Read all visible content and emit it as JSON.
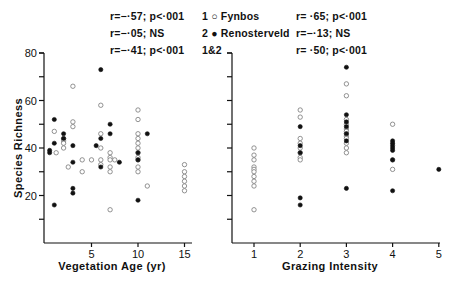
{
  "legend": {
    "items": [
      {
        "number": "1",
        "symbol": "open-circle",
        "label": "Fynbos"
      },
      {
        "number": "2",
        "symbol": "filled-circle",
        "label": "Renosterveld"
      },
      {
        "number": "1&2",
        "symbol": "",
        "label": ""
      }
    ],
    "line1": "1 ○ Fynbos",
    "line2": "2 ● Renosterveld",
    "line3": "1&2"
  },
  "left_stats": {
    "fynbos": "r=−·57; p<·001",
    "renosterveld": "r=−·05; NS",
    "combined": "r=−·41; p<·001"
  },
  "right_stats": {
    "fynbos": "r= ·65; p<·001",
    "renosterveld": "r=−·13; NS",
    "combined": "r= ·50; p<·001"
  },
  "chart_data": [
    {
      "type": "scatter",
      "title": "",
      "xlabel": "Vegetation Age (yr)",
      "ylabel": "Species Richness",
      "xlim": [
        0,
        19
      ],
      "ylim": [
        0,
        80
      ],
      "xticks": [
        5,
        10,
        15
      ],
      "yticks": [
        20,
        40,
        60,
        80
      ],
      "grid": false,
      "series": [
        {
          "name": "Fynbos",
          "marker": "open-circle",
          "points": [
            [
              1,
              47
            ],
            [
              1.2,
              38
            ],
            [
              3,
              66
            ],
            [
              3,
              51
            ],
            [
              3,
              49
            ],
            [
              2,
              44
            ],
            [
              2,
              43
            ],
            [
              2,
              42
            ],
            [
              2,
              40
            ],
            [
              2.5,
              32
            ],
            [
              6,
              58
            ],
            [
              6,
              46
            ],
            [
              6,
              40
            ],
            [
              6,
              35
            ],
            [
              6,
              33
            ],
            [
              4,
              35
            ],
            [
              5,
              35
            ],
            [
              4,
              30
            ],
            [
              7,
              38
            ],
            [
              7,
              36
            ],
            [
              7,
              35
            ],
            [
              7,
              32
            ],
            [
              7,
              30
            ],
            [
              7,
              14
            ],
            [
              7.5,
              35
            ],
            [
              10,
              56
            ],
            [
              10,
              52
            ],
            [
              10,
              46
            ],
            [
              10,
              44
            ],
            [
              10,
              42
            ],
            [
              10,
              40
            ],
            [
              10,
              38
            ],
            [
              10,
              36
            ],
            [
              10,
              35
            ],
            [
              10,
              32
            ],
            [
              10,
              30
            ],
            [
              11,
              24
            ],
            [
              15,
              33
            ],
            [
              15,
              30
            ],
            [
              15,
              28
            ],
            [
              15,
              26
            ],
            [
              15,
              24
            ],
            [
              15,
              22
            ]
          ]
        },
        {
          "name": "Renosterveld",
          "marker": "filled-circle",
          "points": [
            [
              6,
              73
            ],
            [
              1,
              52
            ],
            [
              0.5,
              39
            ],
            [
              0.5,
              38
            ],
            [
              1,
              42
            ],
            [
              2,
              46
            ],
            [
              2,
              44
            ],
            [
              3,
              41
            ],
            [
              3,
              34
            ],
            [
              3,
              23
            ],
            [
              3,
              21
            ],
            [
              6,
              44
            ],
            [
              6,
              32
            ],
            [
              1,
              16
            ],
            [
              5.5,
              41
            ],
            [
              7,
              50
            ],
            [
              7,
              46
            ],
            [
              8,
              34
            ],
            [
              10,
              38
            ],
            [
              10,
              35
            ],
            [
              10,
              18
            ],
            [
              11,
              46
            ]
          ]
        }
      ],
      "annotations": [
        "r=−·57; p<·001",
        "r=−·05; NS",
        "r=−·41; p<·001"
      ]
    },
    {
      "type": "scatter",
      "title": "",
      "xlabel": "Grazing Intensity",
      "ylabel": "Species Richness",
      "xlim": [
        0.5,
        5
      ],
      "ylim": [
        0,
        80
      ],
      "xticks": [
        1,
        2,
        3,
        4,
        5
      ],
      "yticks": [
        20,
        40,
        60,
        80
      ],
      "grid": false,
      "series": [
        {
          "name": "Fynbos",
          "marker": "open-circle",
          "points": [
            [
              1,
              40
            ],
            [
              1,
              37
            ],
            [
              1,
              35
            ],
            [
              1,
              32
            ],
            [
              1,
              31
            ],
            [
              1,
              30
            ],
            [
              1,
              28
            ],
            [
              1,
              26
            ],
            [
              1,
              24
            ],
            [
              1,
              14
            ],
            [
              2,
              56
            ],
            [
              2,
              53
            ],
            [
              2,
              44
            ],
            [
              2,
              42
            ],
            [
              2,
              40
            ],
            [
              2,
              38
            ],
            [
              2,
              36
            ],
            [
              2,
              35
            ],
            [
              3,
              67
            ],
            [
              3,
              62
            ],
            [
              3,
              52
            ],
            [
              3,
              50
            ],
            [
              3,
              48
            ],
            [
              3,
              47
            ],
            [
              3,
              46
            ],
            [
              3,
              45
            ],
            [
              3,
              44
            ],
            [
              3,
              42
            ],
            [
              3,
              40
            ],
            [
              3,
              38
            ],
            [
              4,
              50
            ],
            [
              4,
              35
            ],
            [
              4,
              31
            ]
          ]
        },
        {
          "name": "Renosterveld",
          "marker": "filled-circle",
          "points": [
            [
              2,
              49
            ],
            [
              2,
              41
            ],
            [
              2,
              38
            ],
            [
              2,
              19
            ],
            [
              2,
              16
            ],
            [
              3,
              74
            ],
            [
              3,
              54
            ],
            [
              3,
              51
            ],
            [
              3,
              49
            ],
            [
              3,
              46
            ],
            [
              3,
              43
            ],
            [
              3,
              23
            ],
            [
              4,
              43
            ],
            [
              4,
              42
            ],
            [
              4,
              41
            ],
            [
              4,
              40
            ],
            [
              4,
              39
            ],
            [
              4,
              35
            ],
            [
              4,
              22
            ],
            [
              5,
              31
            ]
          ]
        }
      ],
      "annotations": [
        "r= ·65; p<·001",
        "r=−·13; NS",
        "r= ·50; p<·001"
      ]
    }
  ]
}
